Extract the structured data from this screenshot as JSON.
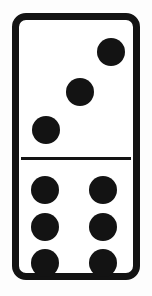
{
  "scene": {
    "subject": "domino-tile",
    "background_color": "#fdfdfd",
    "caption": "Domino tile 3-6"
  },
  "domino": {
    "label": "Domino 3 | 6",
    "tile_color": "#ffffff",
    "border_color": "#131313",
    "pip_color": "#131313",
    "divider_color": "#131313",
    "top_value": "3",
    "bottom_value": "6",
    "total_value": "9",
    "halves": [
      {
        "name": "top-half",
        "value": "3",
        "arrangement": "diagonal",
        "pips": [
          {
            "name": "pip-top-right",
            "position": "top-right"
          },
          {
            "name": "pip-center",
            "position": "center"
          },
          {
            "name": "pip-bottom-left",
            "position": "bottom-left"
          }
        ]
      },
      {
        "name": "bottom-half",
        "value": "6",
        "arrangement": "two-columns-of-three",
        "pips": [
          {
            "name": "pip-left-top",
            "position": "left-top"
          },
          {
            "name": "pip-left-middle",
            "position": "left-middle"
          },
          {
            "name": "pip-left-bottom",
            "position": "left-bottom"
          },
          {
            "name": "pip-right-top",
            "position": "right-top"
          },
          {
            "name": "pip-right-middle",
            "position": "right-middle"
          },
          {
            "name": "pip-right-bottom",
            "position": "right-bottom"
          }
        ]
      }
    ]
  }
}
